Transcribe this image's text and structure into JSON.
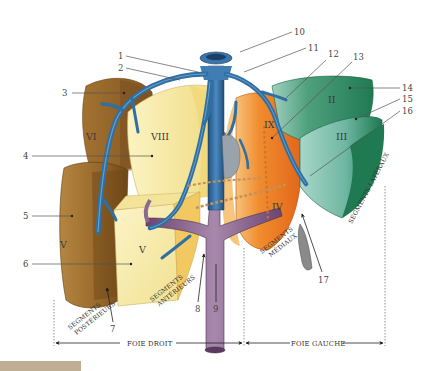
{
  "figure": {
    "callouts": [
      {
        "num": "1",
        "x": 118,
        "y": 58
      },
      {
        "num": "2",
        "x": 118,
        "y": 70
      },
      {
        "num": "3",
        "x": 64,
        "y": 96
      },
      {
        "num": "4",
        "x": 24,
        "y": 158
      },
      {
        "num": "5",
        "x": 24,
        "y": 219
      },
      {
        "num": "6",
        "x": 24,
        "y": 266
      },
      {
        "num": "7",
        "x": 113,
        "y": 330
      },
      {
        "num": "8",
        "x": 196,
        "y": 310
      },
      {
        "num": "9",
        "x": 217,
        "y": 310
      },
      {
        "num": "10",
        "x": 294,
        "y": 34
      },
      {
        "num": "11",
        "x": 308,
        "y": 50
      },
      {
        "num": "12",
        "x": 330,
        "y": 56
      },
      {
        "num": "13",
        "x": 356,
        "y": 59
      },
      {
        "num": "14",
        "x": 403,
        "y": 91
      },
      {
        "num": "15",
        "x": 403,
        "y": 101
      },
      {
        "num": "16",
        "x": 403,
        "y": 114
      },
      {
        "num": "17",
        "x": 322,
        "y": 281
      }
    ],
    "segments": [
      {
        "id": "seg-II",
        "label": "II",
        "color": "#2e8a5e"
      },
      {
        "id": "seg-III",
        "label": "III",
        "color": "#7fbfae"
      },
      {
        "id": "seg-IV",
        "label": "IV",
        "color": "#e8741c"
      },
      {
        "id": "seg-V",
        "label": "V",
        "color": "#f6eeb0"
      },
      {
        "id": "seg-VI",
        "label": "VI",
        "color": "#a8782f"
      },
      {
        "id": "seg-VII",
        "label": "VII",
        "color": "#9a6a2a"
      },
      {
        "id": "seg-VIII",
        "label": "VIII",
        "color": "#f7eba5"
      },
      {
        "id": "seg-IX",
        "label": "IX",
        "color": "#e8741c"
      }
    ],
    "captions": {
      "posterior": [
        "SEGMENTS",
        "POSTÉRIEURS"
      ],
      "anterior": [
        "SEGMENTS",
        "ANTÉRIEURS"
      ],
      "medial": [
        "SEGMENTS",
        "MÉDIAUX"
      ],
      "lateral": "SEGMENTS LATÉRAUX"
    },
    "footer": {
      "right_liver": "FOIE DROIT",
      "left_liver": "FOIE GAUCHE"
    },
    "colors": {
      "vein": "#2f6fa3",
      "vein_light": "#5e9bcc",
      "portal": "#8a5f8e",
      "tan_bar": "#bfae93"
    }
  }
}
